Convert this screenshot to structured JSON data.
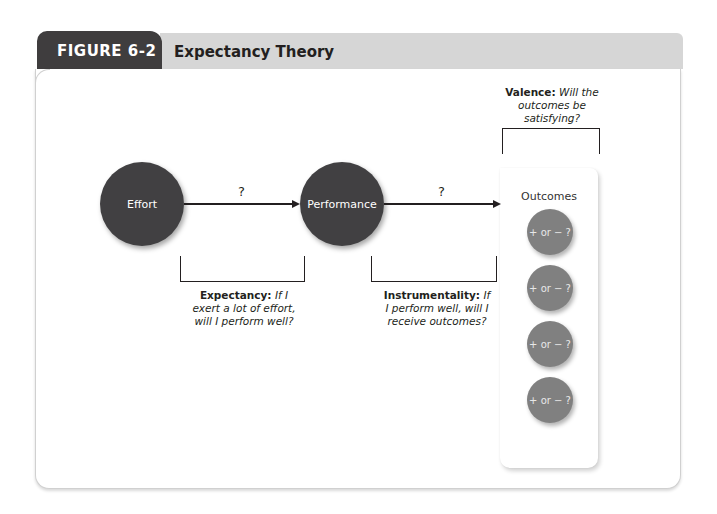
{
  "header": {
    "figure_label": "FIGURE 6-2",
    "title": "Expectancy Theory"
  },
  "nodes": {
    "effort": "Effort",
    "performance": "Performance"
  },
  "arrows": {
    "effort_to_performance": "?",
    "performance_to_outcomes": "?"
  },
  "outcomes": {
    "title": "Outcomes",
    "items": [
      {
        "label": "+ or − ?"
      },
      {
        "label": "+ or − ?"
      },
      {
        "label": "+ or − ?"
      },
      {
        "label": "+ or − ?"
      }
    ]
  },
  "captions": {
    "expectancy": {
      "term": "Expectancy:",
      "question": "If I exert a lot of effort, will I perform well?"
    },
    "instrumentality": {
      "term": "Instrumentality:",
      "question": "If I perform well, will I receive outcomes?"
    },
    "valence": {
      "term": "Valence:",
      "question": "Will the outcomes be satisfying?"
    }
  },
  "colors": {
    "tab": "#3f3d3e",
    "header_band": "#d6d6d6",
    "node_dark": "#414042",
    "outcome_gray": "#808080"
  }
}
